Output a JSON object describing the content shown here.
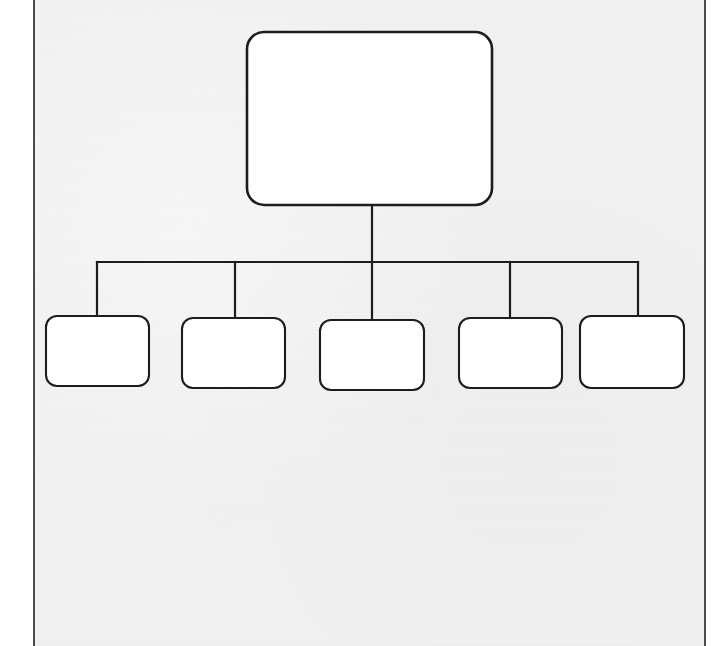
{
  "document": {
    "kind": "scanned-sheet",
    "page_background_color": "#f1f1f1",
    "outside_color": "#ffffff",
    "border_color": "#4a4a4a",
    "ink_color": "#1d1d1d",
    "node_fill_color": "#ffffff"
  },
  "diagram": {
    "type": "hierarchy",
    "title": "",
    "orientation": "top-down",
    "connector_style": "orthogonal-bus",
    "root": {
      "id": "root",
      "label": "",
      "shape": "rounded-rectangle",
      "x": 247,
      "y": 32,
      "width": 245,
      "height": 173,
      "corner_radius": 17
    },
    "bus": {
      "y": 262,
      "x_start": 97,
      "x_end": 638,
      "stem_x": 372,
      "stem_from_y": 205
    },
    "children": [
      {
        "id": "child-1",
        "label": "",
        "shape": "rounded-rectangle",
        "x": 46,
        "y": 316,
        "width": 103,
        "height": 70,
        "corner_radius": 11,
        "connector_x": 97
      },
      {
        "id": "child-2",
        "label": "",
        "shape": "rounded-rectangle",
        "x": 182,
        "y": 318,
        "width": 103,
        "height": 70,
        "corner_radius": 11,
        "connector_x": 235
      },
      {
        "id": "child-3",
        "label": "",
        "shape": "rounded-rectangle",
        "x": 320,
        "y": 320,
        "width": 104,
        "height": 70,
        "corner_radius": 11,
        "connector_x": 372
      },
      {
        "id": "child-4",
        "label": "",
        "shape": "rounded-rectangle",
        "x": 459,
        "y": 318,
        "width": 103,
        "height": 70,
        "corner_radius": 11,
        "connector_x": 510
      },
      {
        "id": "child-5",
        "label": "",
        "shape": "rounded-rectangle",
        "x": 580,
        "y": 316,
        "width": 104,
        "height": 72,
        "corner_radius": 11,
        "connector_x": 638
      }
    ]
  }
}
